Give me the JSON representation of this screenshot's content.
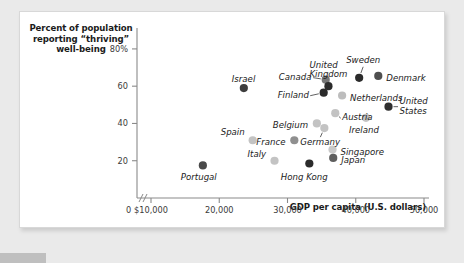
{
  "figure": {
    "y_axis_title": "Percent of population reporting “thriving” well-being",
    "x_axis_title": "GDP per capita (U.S. dollars)",
    "zero_label": "0"
  },
  "chart_data": {
    "type": "scatter",
    "title": "",
    "xlabel": "GDP per capita (U.S. dollars)",
    "ylabel": "Percent of population reporting “thriving” well-being",
    "xlim": [
      10000,
      50000
    ],
    "ylim": [
      0,
      88
    ],
    "grid": false,
    "legend": "none",
    "axis_break": "//",
    "xticks": [
      10000,
      20000,
      30000,
      40000,
      50000
    ],
    "xtick_labels": [
      "$10,000",
      "20,000",
      "30,000",
      "40,000",
      "50,000"
    ],
    "yticks": [
      20,
      40,
      60,
      80
    ],
    "ytick_labels": [
      "20",
      "40",
      "60",
      "80%"
    ],
    "points": [
      {
        "name": "Portugal",
        "x": 17600,
        "y": 17.5,
        "color": "#4a4a4a",
        "label_dx": -4,
        "label_dy": 13,
        "label_anchor": "middle"
      },
      {
        "name": "Israel",
        "x": 23600,
        "y": 59.0,
        "color": "#3d3d3d",
        "label_dx": 0,
        "label_dy": -8,
        "label_anchor": "middle"
      },
      {
        "name": "Spain",
        "x": 24900,
        "y": 31.0,
        "color": "#c3c3c3",
        "label_dx": -8,
        "label_dy": -7,
        "label_anchor": "end"
      },
      {
        "name": "Italy",
        "x": 28100,
        "y": 20.0,
        "color": "#c3c3c3",
        "label_dx": -8,
        "label_dy": -6,
        "label_anchor": "end"
      },
      {
        "name": "France",
        "x": 31000,
        "y": 31.0,
        "color": "#8f8f8f",
        "label_dx": -9,
        "label_dy": 3,
        "label_anchor": "end"
      },
      {
        "name": "Hong Kong",
        "x": 33200,
        "y": 18.5,
        "color": "#2b2b2b",
        "label_dx": -5,
        "label_dy": 14,
        "label_anchor": "middle"
      },
      {
        "name": "Belgium",
        "x": 34300,
        "y": 40.0,
        "color": "#c3c3c3",
        "label_dx": -9,
        "label_dy": 3,
        "label_anchor": "end"
      },
      {
        "name": "Canada",
        "x": 35600,
        "y": 63.5,
        "color": "#777777",
        "label_dx": -14,
        "label_dy": -2,
        "label_anchor": "end"
      },
      {
        "name": "Finland",
        "x": 35300,
        "y": 56.5,
        "color": "#2b2b2b",
        "label_dx": -15,
        "label_dy": 3,
        "label_anchor": "end"
      },
      {
        "name": "Germany",
        "x": 35400,
        "y": 37.5,
        "color": "#c3c3c3",
        "label_dx": -4,
        "label_dy": 15,
        "label_anchor": "middle"
      },
      {
        "name": "Singapore",
        "x": 36600,
        "y": 26.0,
        "color": "#c9c9c9",
        "label_dx": 8,
        "label_dy": 3,
        "label_anchor": "start"
      },
      {
        "name": "Japan",
        "x": 36700,
        "y": 21.5,
        "color": "#5e5e5e",
        "label_dx": 8,
        "label_dy": 3,
        "label_anchor": "start"
      },
      {
        "name": "United Kingdom",
        "x": 36000,
        "y": 60.0,
        "color": "#2b2b2b",
        "label_dx": 0,
        "label_dy": -16,
        "label_anchor": "middle"
      },
      {
        "name": "Netherlands",
        "x": 38000,
        "y": 55.0,
        "color": "#bdbdbd",
        "label_dx": 8,
        "label_dy": 3,
        "label_anchor": "start"
      },
      {
        "name": "Austria",
        "x": 37000,
        "y": 45.5,
        "color": "#c3c3c3",
        "label_dx": 7,
        "label_dy": 5,
        "label_anchor": "start"
      },
      {
        "name": "Ireland",
        "x": 41500,
        "y": 43.0,
        "color": "#c3c3c3",
        "label_dx": -2,
        "label_dy": 13,
        "label_anchor": "middle"
      },
      {
        "name": "Sweden",
        "x": 40500,
        "y": 64.5,
        "color": "#2b2b2b",
        "label_dx": 4,
        "label_dy": -17,
        "label_anchor": "middle"
      },
      {
        "name": "Denmark",
        "x": 43300,
        "y": 65.5,
        "color": "#4f4f4f",
        "label_dx": 8,
        "label_dy": 3,
        "label_anchor": "start"
      },
      {
        "name": "United States",
        "x": 44800,
        "y": 49.0,
        "color": "#2f2f2f",
        "label_dx": 11,
        "label_dy": 0,
        "label_anchor": "start"
      }
    ],
    "multiline_labels": {
      "United Kingdom": [
        "United",
        "Kingdom"
      ],
      "United States": [
        "United",
        "States"
      ]
    },
    "leader_lines": [
      "Canada",
      "Finland",
      "United Kingdom",
      "Sweden",
      "Germany",
      "United States",
      "Austria"
    ]
  }
}
